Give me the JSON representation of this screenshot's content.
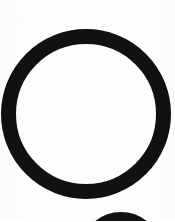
{
  "document": {
    "kind": "scanned-page-fragment",
    "media": "photocopy",
    "width_px": 175,
    "height_px": 221,
    "background_color": "#fdfdfc",
    "ink_color": "#111111",
    "visible_text": "",
    "text_present": false
  },
  "marks": [
    {
      "name": "large-circle-outline",
      "shape": "circle-outline",
      "center_x": 86,
      "center_y": 114,
      "outer_radius": 85,
      "stroke_width": 15,
      "color": "#111111",
      "clipped_edges": [
        "left",
        "right"
      ],
      "note": "Large bold hand-drawn / stamped ring, empty white interior"
    },
    {
      "name": "small-circle-top-arc",
      "shape": "circle-outline-partial",
      "center_x": 121,
      "center_y": 253,
      "outer_radius": 41,
      "stroke_width": 11,
      "color": "#111111",
      "clipped_edges": [
        "bottom"
      ],
      "note": "Only the uppermost arc of a second smaller ring is visible at the bottom edge"
    }
  ],
  "artifacts": {
    "name": "scan-noise",
    "type": "speckle",
    "opacity": 0.55,
    "description": "faint gray toner speckles and edge streaks typical of a photocopy"
  }
}
